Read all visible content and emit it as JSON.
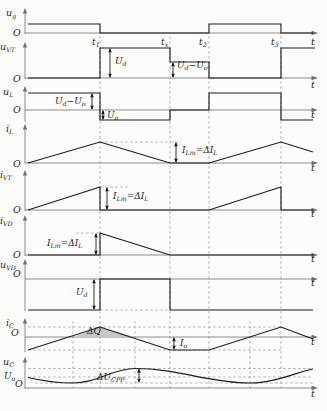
{
  "figure": {
    "width": 327,
    "height": 411,
    "x_origin": 25,
    "colors": {
      "waveform": "#1c1c1c",
      "axis": "#707070",
      "dashed": "#9b9b9b",
      "shading": "#c7c7c7",
      "background": "#fcfcfa"
    },
    "guides_main": {
      "xs": [
        100,
        170,
        209,
        281
      ],
      "y1": 36,
      "y2": 388
    },
    "guides_extra": {
      "xs": [
        73,
        135,
        250
      ],
      "y1": 321,
      "y2": 388
    },
    "time_ticks": [
      {
        "x": 92,
        "y": 45,
        "parts": [
          [
            "t"
          ],
          [
            "1",
            "s"
          ]
        ]
      },
      {
        "x": 161,
        "y": 45,
        "parts": [
          [
            "t"
          ],
          [
            "x",
            "s"
          ]
        ]
      },
      {
        "x": 199,
        "y": 45,
        "parts": [
          [
            "t"
          ],
          [
            "2",
            "s"
          ]
        ]
      },
      {
        "x": 271,
        "y": 45,
        "parts": [
          [
            "t"
          ],
          [
            "3",
            "s"
          ]
        ]
      }
    ],
    "panels": [
      {
        "id": "u_g",
        "ylabel": {
          "x": 6,
          "y": 16,
          "parts": [
            [
              "u"
            ],
            [
              "g",
              "s"
            ]
          ]
        },
        "vaxis": {
          "x": 25,
          "top": 8,
          "bottom": 34
        },
        "haxis": {
          "y": 33
        },
        "o": {
          "x": 13,
          "y": 36
        },
        "t": {
          "x": 311,
          "y": 45
        },
        "polyline": [
          [
            28,
            24
          ],
          [
            100,
            24
          ],
          [
            100,
            33
          ],
          [
            209,
            33
          ],
          [
            209,
            24
          ],
          [
            281,
            24
          ],
          [
            281,
            33
          ],
          [
            313,
            33
          ]
        ]
      },
      {
        "id": "u_VT",
        "ylabel": {
          "x": 0,
          "y": 50,
          "parts": [
            [
              "u"
            ],
            [
              "VT",
              "s"
            ]
          ]
        },
        "vaxis": {
          "x": 25,
          "top": 42,
          "bottom": 79
        },
        "haxis": {
          "y": 78
        },
        "o": {
          "x": 13,
          "y": 82
        },
        "t": {
          "x": 311,
          "y": 88
        },
        "polyline": [
          [
            28,
            78
          ],
          [
            100,
            78
          ],
          [
            100,
            48
          ],
          [
            170,
            48
          ],
          [
            170,
            62
          ],
          [
            209,
            62
          ],
          [
            209,
            78
          ],
          [
            281,
            78
          ],
          [
            281,
            48
          ],
          [
            315,
            48
          ]
        ],
        "arrows": [
          {
            "x": 110,
            "y1": 48,
            "y2": 78
          },
          {
            "x": 173,
            "y1": 62,
            "y2": 78
          }
        ],
        "labels": [
          {
            "x": 115,
            "y": 64,
            "parts": [
              [
                "U"
              ],
              [
                "d",
                "s"
              ]
            ]
          },
          {
            "x": 177,
            "y": 68,
            "parts": [
              [
                "U"
              ],
              [
                "d",
                "s"
              ],
              [
                "−"
              ],
              [
                "U"
              ],
              [
                "o",
                "s"
              ]
            ]
          }
        ]
      },
      {
        "id": "u_L",
        "ylabel": {
          "x": 3,
          "y": 95,
          "parts": [
            [
              "u"
            ],
            [
              "L",
              "s"
            ]
          ]
        },
        "vaxis": {
          "x": 25,
          "top": 86,
          "bottom": 122
        },
        "haxis": {
          "y": 110
        },
        "o": {
          "x": 13,
          "y": 113
        },
        "t": {
          "x": 311,
          "y": 118
        },
        "polyline": [
          [
            28,
            93
          ],
          [
            100,
            93
          ],
          [
            100,
            120
          ],
          [
            170,
            120
          ],
          [
            170,
            110
          ],
          [
            209,
            110
          ],
          [
            209,
            93
          ],
          [
            281,
            93
          ],
          [
            281,
            120
          ],
          [
            313,
            120
          ]
        ],
        "arrows": [
          {
            "x": 92,
            "y1": 93,
            "y2": 110
          },
          {
            "x": 103,
            "y1": 110,
            "y2": 120
          }
        ],
        "labels": [
          {
            "x": 55,
            "y": 104,
            "parts": [
              [
                "U"
              ],
              [
                "d",
                "s"
              ],
              [
                "−"
              ],
              [
                "U"
              ],
              [
                "o",
                "s"
              ]
            ]
          },
          {
            "x": 107,
            "y": 118,
            "parts": [
              [
                "U"
              ],
              [
                "o",
                "s"
              ]
            ]
          }
        ]
      },
      {
        "id": "i_L",
        "ylabel": {
          "x": 6,
          "y": 132,
          "parts": [
            [
              "i"
            ],
            [
              "L",
              "s"
            ]
          ]
        },
        "vaxis": {
          "x": 25,
          "top": 124,
          "bottom": 164
        },
        "haxis": {
          "y": 163
        },
        "o": {
          "x": 13,
          "y": 167
        },
        "t": {
          "x": 311,
          "y": 171
        },
        "polyline": [
          [
            28,
            163
          ],
          [
            100,
            142
          ],
          [
            170,
            163
          ],
          [
            209,
            163
          ],
          [
            281,
            142
          ],
          [
            313,
            152
          ]
        ],
        "dashed_h": [
          {
            "y": 142,
            "x1": 100,
            "x2": 181
          }
        ],
        "arrows": [
          {
            "x": 176,
            "y1": 142,
            "y2": 163
          }
        ],
        "labels": [
          {
            "x": 182,
            "y": 153,
            "parts": [
              [
                "I"
              ],
              [
                "Lm",
                "s"
              ],
              [
                "=Δ"
              ],
              [
                "I"
              ],
              [
                "L",
                "s"
              ]
            ]
          }
        ]
      },
      {
        "id": "i_VT",
        "ylabel": {
          "x": 0,
          "y": 178,
          "parts": [
            [
              "i"
            ],
            [
              "VT",
              "s"
            ]
          ]
        },
        "vaxis": {
          "x": 25,
          "top": 170,
          "bottom": 211
        },
        "haxis": {
          "y": 210
        },
        "o": {
          "x": 13,
          "y": 213
        },
        "t": {
          "x": 311,
          "y": 217
        },
        "polyline": [
          [
            28,
            210
          ],
          [
            100,
            187
          ],
          [
            100,
            210
          ],
          [
            209,
            210
          ],
          [
            281,
            187
          ],
          [
            281,
            210
          ],
          [
            313,
            210
          ]
        ],
        "dashed_h": [
          {
            "y": 187,
            "x1": 100,
            "x2": 128
          }
        ],
        "arrows": [
          {
            "x": 107,
            "y1": 187,
            "y2": 210
          }
        ],
        "labels": [
          {
            "x": 113,
            "y": 199,
            "parts": [
              [
                "I"
              ],
              [
                "Lm",
                "s"
              ],
              [
                "=Δ"
              ],
              [
                "I"
              ],
              [
                "L",
                "s"
              ]
            ]
          }
        ]
      },
      {
        "id": "i_VD",
        "ylabel": {
          "x": 0,
          "y": 224,
          "parts": [
            [
              "i"
            ],
            [
              "VD",
              "s"
            ]
          ]
        },
        "vaxis": {
          "x": 25,
          "top": 215,
          "bottom": 256
        },
        "haxis": {
          "y": 255
        },
        "o": {
          "x": 13,
          "y": 258
        },
        "t": {
          "x": 311,
          "y": 262
        },
        "polyline": [
          [
            28,
            255
          ],
          [
            100,
            255
          ],
          [
            100,
            233
          ],
          [
            170,
            255
          ],
          [
            313,
            255
          ]
        ],
        "dashed_h": [
          {
            "y": 233,
            "x1": 76,
            "x2": 100
          }
        ],
        "arrows": [
          {
            "x": 96,
            "y1": 233,
            "y2": 255
          }
        ],
        "labels": [
          {
            "x": 47,
            "y": 246,
            "parts": [
              [
                "I"
              ],
              [
                "Lm",
                "s"
              ],
              [
                "=Δ"
              ],
              [
                "I"
              ],
              [
                "L",
                "s"
              ]
            ]
          }
        ]
      },
      {
        "id": "u_VD",
        "ylabel": {
          "x": 0,
          "y": 268,
          "parts": [
            [
              "u"
            ],
            [
              "VD",
              "s"
            ]
          ]
        },
        "vaxis": {
          "x": 25,
          "top": 259,
          "bottom": 311
        },
        "haxis": {
          "y": 279
        },
        "o": {
          "x": 13,
          "y": 277
        },
        "t": {
          "x": 311,
          "y": 286
        },
        "polyline": [
          [
            28,
            310
          ],
          [
            100,
            310
          ],
          [
            100,
            279
          ],
          [
            170,
            279
          ],
          [
            170,
            310
          ],
          [
            313,
            310
          ]
        ],
        "dashed_h": [
          {
            "y": 310,
            "x1": 100,
            "x2": 170
          }
        ],
        "arrows": [
          {
            "x": 94,
            "y1": 279,
            "y2": 310
          }
        ],
        "labels": [
          {
            "x": 76,
            "y": 295,
            "parts": [
              [
                "U"
              ],
              [
                "d",
                "s"
              ]
            ]
          }
        ]
      },
      {
        "id": "i_C",
        "ylabel": {
          "x": 6,
          "y": 326,
          "parts": [
            [
              "i"
            ],
            [
              "C",
              "s"
            ]
          ]
        },
        "vaxis": {
          "x": 25,
          "top": 318,
          "bottom": 352
        },
        "haxis": {
          "y": 337
        },
        "o": {
          "x": 11,
          "y": 336
        },
        "t": {
          "x": 311,
          "y": 345
        },
        "polyline": [
          [
            28,
            350
          ],
          [
            100,
            327
          ],
          [
            170,
            350
          ],
          [
            209,
            350
          ],
          [
            281,
            327
          ],
          [
            313,
            339
          ]
        ],
        "dashed_h": [
          {
            "y": 327,
            "x1": 28,
            "x2": 281
          },
          {
            "y": 350,
            "x1": 28,
            "x2": 281
          }
        ],
        "shade": {
          "points": [
            [
              73,
              337
            ],
            [
              100,
              327
            ],
            [
              135,
              337
            ]
          ]
        },
        "arrows": [
          {
            "x": 174,
            "y1": 337,
            "y2": 350
          }
        ],
        "labels": [
          {
            "x": 87,
            "y": 334,
            "parts": [
              [
                "Δ"
              ],
              [
                "Q"
              ]
            ]
          },
          {
            "x": 180,
            "y": 346,
            "parts": [
              [
                "I"
              ],
              [
                "o",
                "s"
              ]
            ]
          }
        ]
      },
      {
        "id": "u_C",
        "ylabel": {
          "x": 3,
          "y": 365,
          "parts": [
            [
              "u"
            ],
            [
              "C",
              "s"
            ]
          ]
        },
        "vaxis": {
          "x": 25,
          "top": 357,
          "bottom": 389
        },
        "haxis": {
          "y": 388
        },
        "o": {
          "x": 15,
          "y": 387
        },
        "t": {
          "x": 311,
          "y": 397
        },
        "smooth_path": "M 28 377.5 C 45 381.5 58 383 73 383 C 98 383 112 368.5 135 368.5 C 180 368.5 207 383 250 383 C 274 383 296 372.5 313 369",
        "dashed_h": [
          {
            "y": 368.5,
            "x1": 28,
            "x2": 313
          },
          {
            "y": 377,
            "x1": 28,
            "x2": 313
          },
          {
            "y": 383,
            "x1": 35,
            "x2": 313
          }
        ],
        "arrows": [
          {
            "x": 139,
            "y1": 368.5,
            "y2": 383
          }
        ],
        "labels": [
          {
            "x": 4,
            "y": 379,
            "parts": [
              [
                "U"
              ],
              [
                "o",
                "s"
              ]
            ]
          },
          {
            "x": 97,
            "y": 380,
            "parts": [
              [
                "Δ"
              ],
              [
                "U"
              ],
              [
                "CPP",
                "s"
              ]
            ]
          }
        ]
      }
    ]
  },
  "chart_data": [
    {
      "name": "u_g",
      "type": "line",
      "xlabel": "t",
      "x_ticks": [
        "t1",
        "tx",
        "t2",
        "t3"
      ],
      "segments": [
        [
          "0–t1",
          "high"
        ],
        [
          "t1–t2",
          "0"
        ],
        [
          "t2–t3",
          "high"
        ],
        [
          "t3–end",
          "0"
        ]
      ]
    },
    {
      "name": "u_VT",
      "type": "line",
      "xlabel": "t",
      "segments": [
        [
          "0–t1",
          "0"
        ],
        [
          "t1–tx",
          "Ud"
        ],
        [
          "tx–t2",
          "Ud−Uo"
        ],
        [
          "t2–t3",
          "0"
        ],
        [
          "t3–end",
          "Ud"
        ]
      ],
      "annotations": [
        "Ud",
        "Ud−Uo"
      ]
    },
    {
      "name": "u_L",
      "type": "line",
      "xlabel": "t",
      "segments": [
        [
          "0–t1",
          "Ud−Uo"
        ],
        [
          "t1–tx",
          "−Uo"
        ],
        [
          "tx–t2",
          "0"
        ],
        [
          "t2–t3",
          "Ud−Uo"
        ],
        [
          "t3–end",
          "−Uo"
        ]
      ],
      "annotations": [
        "Ud−Uo",
        "Uo"
      ]
    },
    {
      "name": "i_L",
      "type": "line",
      "xlabel": "t",
      "segments": [
        [
          "0–t1",
          "ramp 0→ILm"
        ],
        [
          "t1–tx",
          "ramp ILm→0"
        ],
        [
          "tx–t2",
          "0"
        ],
        [
          "t2–t3",
          "ramp 0→ILm"
        ],
        [
          "t3–end",
          "ramp down"
        ]
      ],
      "annotations": [
        "ILm=ΔIL"
      ]
    },
    {
      "name": "i_VT",
      "type": "line",
      "xlabel": "t",
      "segments": [
        [
          "0–t1",
          "ramp 0→ILm"
        ],
        [
          "t1–t2",
          "0"
        ],
        [
          "t2–t3",
          "ramp 0→ILm"
        ],
        [
          "t3–end",
          "0"
        ]
      ],
      "annotations": [
        "ILm=ΔIL"
      ]
    },
    {
      "name": "i_VD",
      "type": "line",
      "xlabel": "t",
      "segments": [
        [
          "0–t1",
          "0"
        ],
        [
          "t1–tx",
          "ramp ILm→0"
        ],
        [
          "tx–end",
          "0"
        ]
      ],
      "annotations": [
        "ILm=ΔIL"
      ]
    },
    {
      "name": "u_VD",
      "type": "line",
      "xlabel": "t",
      "segments": [
        [
          "0–t1",
          "−Ud"
        ],
        [
          "t1–tx",
          "0"
        ],
        [
          "tx–end",
          "−Ud"
        ]
      ],
      "annotations": [
        "Ud"
      ]
    },
    {
      "name": "i_C",
      "type": "line",
      "xlabel": "t",
      "segments": [
        [
          "0–t1",
          "ramp −Io→+peak"
        ],
        [
          "t1–tx",
          "ramp +peak→−Io"
        ],
        [
          "tx–t2",
          "−Io"
        ],
        [
          "t2–t3",
          "ramp −Io→+peak"
        ],
        [
          "t3–end",
          "ramp down"
        ]
      ],
      "annotations": [
        "ΔQ (shaded area above zero)",
        "Io"
      ]
    },
    {
      "name": "u_C",
      "type": "line",
      "xlabel": "t",
      "segments": [
        [
          "all",
          "ripple wave around Uo: min at iC up-crossings, max at iC down-crossing, peak-to-peak ΔUCPP"
        ]
      ],
      "annotations": [
        "Uo",
        "ΔUCPP"
      ]
    }
  ]
}
